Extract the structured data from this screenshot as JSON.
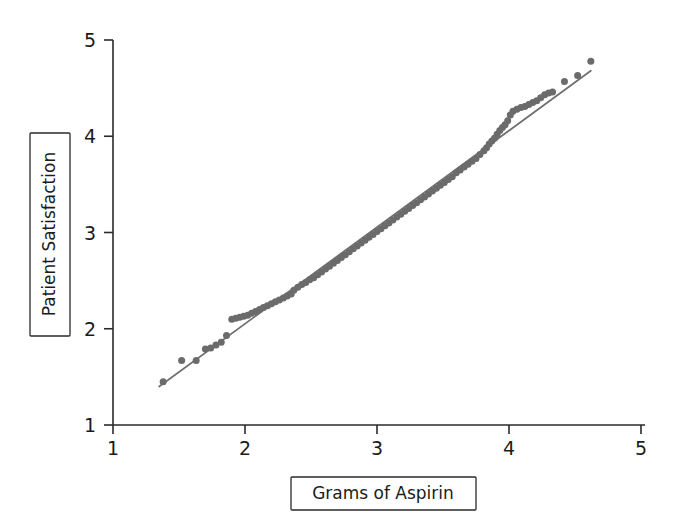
{
  "figure": {
    "background_color": "#ffffff",
    "width": 674,
    "height": 526
  },
  "axis_titles": {
    "y_label": "Patient Satisfaction",
    "x_label": "Grams of Aspirin"
  },
  "chart_data": {
    "type": "scatter",
    "title": "",
    "subtitle": "",
    "xlabel": "Grams of Aspirin",
    "ylabel": "Patient Satisfaction",
    "xlim": [
      1,
      5
    ],
    "ylim": [
      1,
      5
    ],
    "xticks": [
      1,
      2,
      3,
      4,
      5
    ],
    "yticks": [
      1,
      2,
      3,
      4,
      5
    ],
    "xtick_labels": [
      "1",
      "2",
      "3",
      "4",
      "5"
    ],
    "ytick_labels": [
      "1",
      "2",
      "3",
      "4",
      "5"
    ],
    "grid": false,
    "legend": false,
    "legend_position": "none",
    "marker_color": "#6b6b6b",
    "marker_shape": "circle",
    "marker_size_px": 7,
    "reference_line": {
      "name": "identity-reference-line",
      "color": "#6e6e6e",
      "width_px": 1.7,
      "x_start": 1.35,
      "y_start": 1.4,
      "x_end": 4.62,
      "y_end": 4.68
    },
    "annotations": [],
    "series": [
      {
        "name": "Q-Q points",
        "color": "#6b6b6b",
        "points": [
          [
            1.38,
            1.45
          ],
          [
            1.52,
            1.67
          ],
          [
            1.63,
            1.67
          ],
          [
            1.7,
            1.79
          ],
          [
            1.74,
            1.8
          ],
          [
            1.78,
            1.83
          ],
          [
            1.82,
            1.86
          ],
          [
            1.86,
            1.93
          ],
          [
            1.9,
            2.1
          ],
          [
            1.93,
            2.11
          ],
          [
            1.96,
            2.12
          ],
          [
            1.99,
            2.13
          ],
          [
            2.02,
            2.14
          ],
          [
            2.05,
            2.16
          ],
          [
            2.08,
            2.18
          ],
          [
            2.11,
            2.2
          ],
          [
            2.14,
            2.22
          ],
          [
            2.17,
            2.24
          ],
          [
            2.2,
            2.26
          ],
          [
            2.23,
            2.28
          ],
          [
            2.26,
            2.3
          ],
          [
            2.29,
            2.32
          ],
          [
            2.32,
            2.34
          ],
          [
            2.35,
            2.36
          ],
          [
            2.37,
            2.4
          ],
          [
            2.4,
            2.43
          ],
          [
            2.43,
            2.46
          ],
          [
            2.46,
            2.48
          ],
          [
            2.49,
            2.51
          ],
          [
            2.52,
            2.53
          ],
          [
            2.55,
            2.56
          ],
          [
            2.58,
            2.59
          ],
          [
            2.61,
            2.62
          ],
          [
            2.64,
            2.65
          ],
          [
            2.67,
            2.68
          ],
          [
            2.7,
            2.71
          ],
          [
            2.73,
            2.74
          ],
          [
            2.76,
            2.77
          ],
          [
            2.79,
            2.8
          ],
          [
            2.82,
            2.83
          ],
          [
            2.85,
            2.86
          ],
          [
            2.88,
            2.89
          ],
          [
            2.91,
            2.92
          ],
          [
            2.94,
            2.95
          ],
          [
            2.97,
            2.98
          ],
          [
            3.0,
            3.01
          ],
          [
            3.03,
            3.04
          ],
          [
            3.06,
            3.07
          ],
          [
            3.09,
            3.1
          ],
          [
            3.12,
            3.13
          ],
          [
            3.15,
            3.16
          ],
          [
            3.18,
            3.19
          ],
          [
            3.21,
            3.22
          ],
          [
            3.24,
            3.25
          ],
          [
            3.27,
            3.28
          ],
          [
            3.3,
            3.31
          ],
          [
            3.33,
            3.34
          ],
          [
            3.36,
            3.37
          ],
          [
            3.39,
            3.4
          ],
          [
            3.42,
            3.43
          ],
          [
            3.45,
            3.46
          ],
          [
            3.48,
            3.49
          ],
          [
            3.51,
            3.52
          ],
          [
            3.54,
            3.55
          ],
          [
            3.57,
            3.58
          ],
          [
            3.6,
            3.62
          ],
          [
            3.63,
            3.65
          ],
          [
            3.66,
            3.68
          ],
          [
            3.69,
            3.71
          ],
          [
            3.72,
            3.74
          ],
          [
            3.75,
            3.77
          ],
          [
            3.78,
            3.81
          ],
          [
            3.81,
            3.85
          ],
          [
            3.83,
            3.88
          ],
          [
            3.85,
            3.92
          ],
          [
            3.87,
            3.95
          ],
          [
            3.89,
            3.98
          ],
          [
            3.91,
            4.02
          ],
          [
            3.93,
            4.06
          ],
          [
            3.95,
            4.09
          ],
          [
            3.97,
            4.12
          ],
          [
            3.99,
            4.16
          ],
          [
            4.01,
            4.22
          ],
          [
            4.03,
            4.26
          ],
          [
            4.06,
            4.28
          ],
          [
            4.09,
            4.3
          ],
          [
            4.12,
            4.31
          ],
          [
            4.15,
            4.33
          ],
          [
            4.18,
            4.35
          ],
          [
            4.21,
            4.37
          ],
          [
            4.24,
            4.4
          ],
          [
            4.27,
            4.43
          ],
          [
            4.3,
            4.45
          ],
          [
            4.33,
            4.46
          ],
          [
            4.42,
            4.57
          ],
          [
            4.52,
            4.63
          ],
          [
            4.62,
            4.78
          ]
        ]
      }
    ]
  }
}
